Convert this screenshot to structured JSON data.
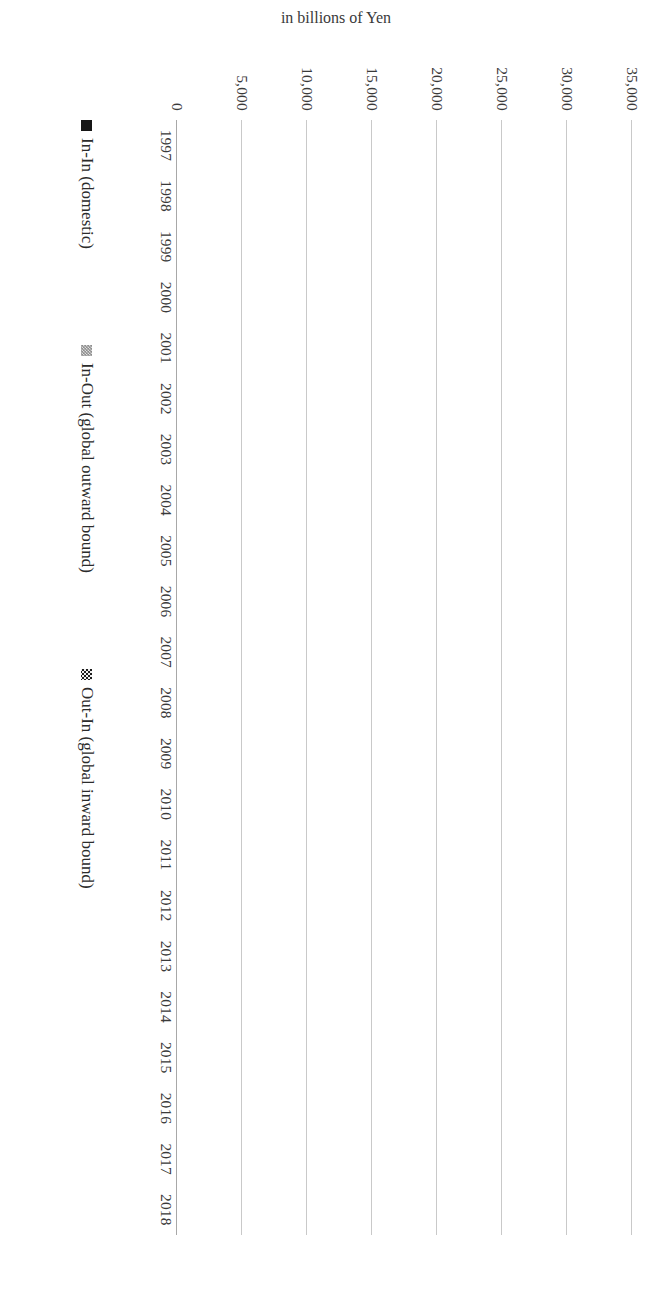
{
  "chart_data": {
    "type": "bar",
    "orientation": "horizontal-stacked",
    "title": "",
    "xlabel": "",
    "ylabel": "in billions of Yen",
    "ylim": [
      0,
      35000
    ],
    "ytick_labels": [
      "0",
      "5,000",
      "10,000",
      "15,000",
      "20,000",
      "25,000",
      "30,000",
      "35,000"
    ],
    "ytick_values": [
      0,
      5000,
      10000,
      15000,
      20000,
      25000,
      30000,
      35000
    ],
    "grid": true,
    "legend_position": "bottom",
    "categories": [
      "1997",
      "1998",
      "1999",
      "2000",
      "2001",
      "2002",
      "2003",
      "2004",
      "2005",
      "2006",
      "2007",
      "2008",
      "2009",
      "2010",
      "2011",
      "2012",
      "2013",
      "2014",
      "2015",
      "2016",
      "2017",
      "2018"
    ],
    "series": [
      {
        "name": "In-In (domestic)",
        "key": "inin",
        "color": "#161616",
        "pattern": "solid",
        "values": [
          60,
          900,
          1050,
          1300,
          1400,
          1700,
          2200,
          4850,
          5000,
          4400,
          3300,
          2050,
          1500,
          1600,
          2400,
          1650,
          1700,
          1600,
          2000,
          2500,
          1900,
          2600
        ]
      },
      {
        "name": "In-Out (global outward bound)",
        "key": "inout",
        "color": "#8e8e8e",
        "pattern": "light-checker",
        "values": [
          120,
          650,
          2400,
          2100,
          1200,
          800,
          900,
          5700,
          5700,
          7000,
          5200,
          7600,
          3100,
          2900,
          6900,
          8100,
          3700,
          4800,
          11800,
          12100,
          4000,
          20300
        ]
      },
      {
        "name": "Out-In (global inward bound)",
        "key": "outin",
        "color": "#1d1d1d",
        "pattern": "dark-checker",
        "values": [
          0,
          450,
          1600,
          1700,
          1300,
          900,
          600,
          800,
          700,
          400,
          1700,
          600,
          400,
          400,
          450,
          350,
          450,
          600,
          900,
          2100,
          1400,
          7400
        ]
      }
    ],
    "totals": [
      180,
      2000,
      5050,
      5100,
      3900,
      3400,
      3700,
      11350,
      11400,
      11800,
      10200,
      10250,
      5000,
      4900,
      9750,
      10100,
      5850,
      7000,
      14700,
      16700,
      7300,
      30300
    ]
  },
  "legend": {
    "items": [
      {
        "label": "In-In (domestic)",
        "key": "inin"
      },
      {
        "label": "In-Out (global outward bound)",
        "key": "inout"
      },
      {
        "label": "Out-In (global inward bound)",
        "key": "outin"
      }
    ]
  }
}
